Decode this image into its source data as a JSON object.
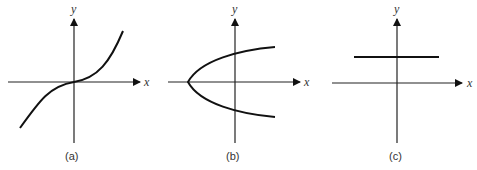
{
  "figure": {
    "panels": [
      {
        "id": "a",
        "caption": "(a)",
        "x_label": "x",
        "y_label": "y",
        "curve": "cubic-like curve through origin (increasing)"
      },
      {
        "id": "b",
        "caption": "(b)",
        "x_label": "x",
        "y_label": "y",
        "curve": "sideways parabola opening right, vertex on negative x-axis"
      },
      {
        "id": "c",
        "caption": "(c)",
        "x_label": "x",
        "y_label": "y",
        "curve": "horizontal line above x-axis"
      }
    ]
  }
}
